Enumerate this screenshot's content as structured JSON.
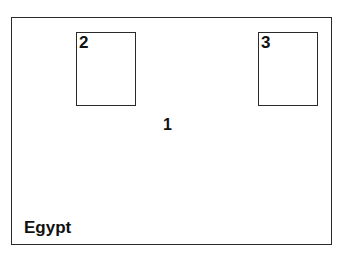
{
  "diagram": {
    "region_label": "Egypt",
    "main_area_label": "1",
    "boxes": [
      {
        "label": "2"
      },
      {
        "label": "3"
      }
    ]
  },
  "colors": {
    "stroke": "#2a2a2a",
    "background": "#ffffff",
    "text": "#111111"
  }
}
